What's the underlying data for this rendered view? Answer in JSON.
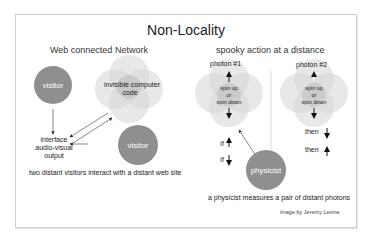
{
  "title": "Non-Locality",
  "left_panel": {
    "heading": "Web connected Network",
    "visitor_top": "visitor",
    "code_label_1": "invisible computer",
    "code_label_2": "code",
    "interface_1": "interface",
    "interface_2": "audio-visual",
    "interface_3": "output",
    "visitor_bottom": "visitor",
    "caption": "two distant visitors interact with a distant web site"
  },
  "right_panel": {
    "heading": "spooky action at a distance",
    "photon1": {
      "label": "photon #1",
      "spin_1": "spin up",
      "spin_2": "or",
      "spin_3": "spin  down",
      "if_1": "If",
      "if_2": "If"
    },
    "photon2": {
      "label": "photon #2",
      "spin_1": "spin up",
      "spin_2": "or",
      "spin_3": "spin  down",
      "then_1": "then",
      "then_2": "then"
    },
    "physicist": "physicist",
    "caption": "a physicist measures a pair of distant photons"
  },
  "credit": "image by Jeremy Levine",
  "colors": {
    "dark_circle": "#8f8f8f",
    "light_blob": "#d9d9d9",
    "frame_border": "#cfcfcf"
  }
}
